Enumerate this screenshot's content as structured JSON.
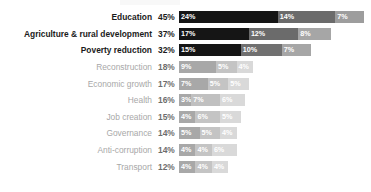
{
  "chart_data": {
    "type": "bar",
    "subtype": "horizontal-stacked",
    "title": "",
    "xlabel": "",
    "ylabel": "",
    "xlim": [
      0,
      45
    ],
    "grid": false,
    "legend": "none",
    "value_suffix": "%",
    "categories": [
      "Education",
      "Agriculture & rural development",
      "Poverty reduction",
      "Reconstruction",
      "Economic growth",
      "Health",
      "Job creation",
      "Governance",
      "Anti-corruption",
      "Transport"
    ],
    "totals": [
      45,
      37,
      32,
      18,
      17,
      16,
      15,
      14,
      14,
      12
    ],
    "total_labels": [
      "45%",
      "37%",
      "32%",
      "18%",
      "17%",
      "16%",
      "15%",
      "14%",
      "14%",
      "12%"
    ],
    "series": [
      {
        "name": "first-priority",
        "values": [
          24,
          17,
          15,
          9,
          7,
          3,
          4,
          5,
          4,
          4
        ]
      },
      {
        "name": "second-priority",
        "values": [
          14,
          12,
          10,
          5,
          5,
          7,
          6,
          5,
          4,
          4
        ]
      },
      {
        "name": "third-priority",
        "values": [
          7,
          8,
          7,
          4,
          5,
          6,
          5,
          4,
          6,
          4
        ]
      }
    ],
    "rows": [
      {
        "label": "Education",
        "total_label": "45%",
        "emphasis": true,
        "segments": [
          {
            "value": 24,
            "label": "24%",
            "color": "#151515",
            "text_color": "#ffffff"
          },
          {
            "value": 14,
            "label": "14%",
            "color": "#6b6b6b",
            "text_color": "#ffffff"
          },
          {
            "value": 7,
            "label": "7%",
            "color": "#9d9d9d",
            "text_color": "#ffffff"
          }
        ]
      },
      {
        "label": "Agriculture & rural development",
        "total_label": "37%",
        "emphasis": true,
        "segments": [
          {
            "value": 17,
            "label": "17%",
            "color": "#151515",
            "text_color": "#ffffff"
          },
          {
            "value": 12,
            "label": "12%",
            "color": "#6b6b6b",
            "text_color": "#ffffff"
          },
          {
            "value": 8,
            "label": "8%",
            "color": "#a6a6a6",
            "text_color": "#ffffff"
          }
        ]
      },
      {
        "label": "Poverty reduction",
        "total_label": "32%",
        "emphasis": true,
        "segments": [
          {
            "value": 15,
            "label": "15%",
            "color": "#151515",
            "text_color": "#ffffff"
          },
          {
            "value": 10,
            "label": "10%",
            "color": "#707070",
            "text_color": "#ffffff"
          },
          {
            "value": 7,
            "label": "7%",
            "color": "#a6a6a6",
            "text_color": "#ffffff"
          }
        ]
      },
      {
        "label": "Reconstruction",
        "total_label": "18%",
        "emphasis": false,
        "segments": [
          {
            "value": 9,
            "label": "9%",
            "color": "#a8a8a8",
            "text_color": "#ffffff"
          },
          {
            "value": 5,
            "label": "5%",
            "color": "#c4c4c4",
            "text_color": "#ffffff"
          },
          {
            "value": 4,
            "label": "4%",
            "color": "#d9d9d9",
            "text_color": "#ffffff"
          }
        ]
      },
      {
        "label": "Economic growth",
        "total_label": "17%",
        "emphasis": false,
        "segments": [
          {
            "value": 7,
            "label": "7%",
            "color": "#a8a8a8",
            "text_color": "#ffffff"
          },
          {
            "value": 5,
            "label": "5%",
            "color": "#c4c4c4",
            "text_color": "#ffffff"
          },
          {
            "value": 5,
            "label": "5%",
            "color": "#d9d9d9",
            "text_color": "#ffffff"
          }
        ]
      },
      {
        "label": "Health",
        "total_label": "16%",
        "emphasis": false,
        "segments": [
          {
            "value": 3,
            "label": "3%",
            "color": "#a8a8a8",
            "text_color": "#ffffff"
          },
          {
            "value": 7,
            "label": "7%",
            "color": "#c0c0c0",
            "text_color": "#ffffff"
          },
          {
            "value": 6,
            "label": "6%",
            "color": "#d9d9d9",
            "text_color": "#ffffff"
          }
        ]
      },
      {
        "label": "Job creation",
        "total_label": "15%",
        "emphasis": false,
        "segments": [
          {
            "value": 4,
            "label": "4%",
            "color": "#a8a8a8",
            "text_color": "#ffffff"
          },
          {
            "value": 6,
            "label": "6%",
            "color": "#c4c4c4",
            "text_color": "#ffffff"
          },
          {
            "value": 5,
            "label": "5%",
            "color": "#d9d9d9",
            "text_color": "#ffffff"
          }
        ]
      },
      {
        "label": "Governance",
        "total_label": "14%",
        "emphasis": false,
        "segments": [
          {
            "value": 5,
            "label": "5%",
            "color": "#a8a8a8",
            "text_color": "#ffffff"
          },
          {
            "value": 5,
            "label": "5%",
            "color": "#c4c4c4",
            "text_color": "#ffffff"
          },
          {
            "value": 4,
            "label": "4%",
            "color": "#d9d9d9",
            "text_color": "#ffffff"
          }
        ]
      },
      {
        "label": "Anti-corruption",
        "total_label": "14%",
        "emphasis": false,
        "segments": [
          {
            "value": 4,
            "label": "4%",
            "color": "#a8a8a8",
            "text_color": "#ffffff"
          },
          {
            "value": 4,
            "label": "4%",
            "color": "#c4c4c4",
            "text_color": "#ffffff"
          },
          {
            "value": 6,
            "label": "6%",
            "color": "#d9d9d9",
            "text_color": "#ffffff"
          }
        ]
      },
      {
        "label": "Transport",
        "total_label": "12%",
        "emphasis": false,
        "segments": [
          {
            "value": 4,
            "label": "4%",
            "color": "#a8a8a8",
            "text_color": "#ffffff"
          },
          {
            "value": 4,
            "label": "4%",
            "color": "#c4c4c4",
            "text_color": "#ffffff"
          },
          {
            "value": 4,
            "label": "4%",
            "color": "#d9d9d9",
            "text_color": "#ffffff"
          }
        ]
      }
    ]
  }
}
